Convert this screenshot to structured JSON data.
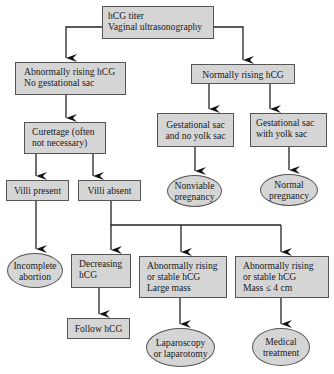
{
  "nodes": {
    "root": {
      "lines": [
        "hCG titer",
        "Vaginal ultrasonography"
      ]
    },
    "abnormal": {
      "lines": [
        "Abnormally rising hCG",
        "No gestational sac"
      ]
    },
    "normal": {
      "lines": [
        "Normally rising hCG"
      ]
    },
    "curettage": {
      "lines": [
        "Curettage (often",
        "not necessary)"
      ]
    },
    "sac_no_yolk": {
      "lines": [
        "Gestational sac",
        "and no yolk sac"
      ]
    },
    "sac_yolk": {
      "lines": [
        "Gestational sac",
        "with yolk sac"
      ]
    },
    "villi_present": {
      "lines": [
        "Villi present"
      ]
    },
    "villi_absent": {
      "lines": [
        "Villi absent"
      ]
    },
    "nonviable": {
      "lines": [
        "Nonviable",
        "pregnancy"
      ]
    },
    "normal_preg": {
      "lines": [
        "Normal",
        "pregnancy"
      ]
    },
    "incomplete": {
      "lines": [
        "Incomplete",
        "abortion"
      ]
    },
    "decreasing": {
      "lines": [
        "Decreasing",
        "hCG"
      ]
    },
    "large_mass": {
      "lines": [
        "Abnormally rising",
        "or stable hCG",
        "Large mass"
      ]
    },
    "small_mass": {
      "lines": [
        "Abnormally rising",
        "or stable hCG",
        "Mass ≤ 4 cm"
      ]
    },
    "follow": {
      "lines": [
        "Follow hCG"
      ]
    },
    "laparoscopy": {
      "lines": [
        "Laparoscopy",
        "or laparotomy"
      ]
    },
    "medical": {
      "lines": [
        "Medical",
        "treatment"
      ]
    }
  },
  "colors": {
    "node_fill": "#d5d5d5",
    "border": "#555555",
    "arrow": "#111111"
  }
}
